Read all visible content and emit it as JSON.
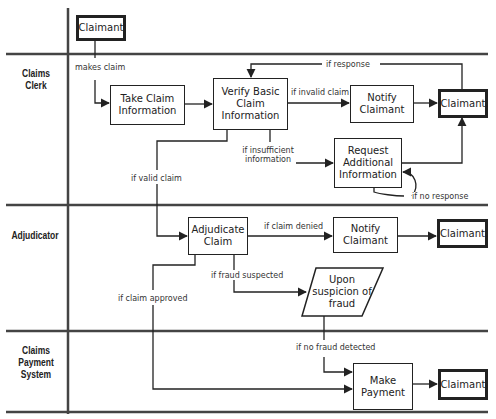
{
  "lanes": [
    {
      "id": "claimant",
      "label": ""
    },
    {
      "id": "claims-clerk",
      "label": "Claims\nClerk"
    },
    {
      "id": "adjudicator",
      "label": "Adjudicator"
    },
    {
      "id": "claims-payment-system",
      "label": "Claims\nPayment\nSystem"
    }
  ],
  "nodes": {
    "claimant_start": "Claimant",
    "take_claim": "Take Claim Information",
    "verify_basic": "Verify Basic Claim Information",
    "notify_claimant_clerk": "Notify Claimant",
    "claimant_clerk": "Claimant",
    "request_additional": "Request Additional Information",
    "adjudicate_claim": "Adjudicate Claim",
    "notify_claimant_adj": "Notify Claimant",
    "claimant_adj": "Claimant",
    "upon_suspicion": "Upon suspicion of fraud",
    "make_payment": "Make Payment",
    "claimant_payment": "Claimant"
  },
  "edge_labels": {
    "makes_claim": "makes claim",
    "if_response": "if response",
    "if_invalid_claim": "if invalid claim",
    "if_insufficient_information": "if insufficient information",
    "if_valid_claim": "if valid claim",
    "if_no_response": "if no response",
    "if_claim_denied": "if claim denied",
    "if_fraud_suspected": "if fraud suspected",
    "if_claim_approved": "if claim approved",
    "if_no_fraud_detected": "if no fraud detected"
  },
  "colors": {
    "line": "#333333",
    "background": "#ffffff"
  }
}
